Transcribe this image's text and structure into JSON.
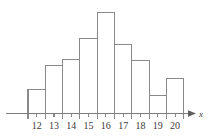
{
  "chart_data": {
    "type": "bar",
    "title": "",
    "subtitle": "",
    "xlabel": "x",
    "ylabel": "",
    "categories": [
      "12",
      "13",
      "14",
      "15",
      "16",
      "17",
      "18",
      "19",
      "20"
    ],
    "values": [
      24,
      48,
      54,
      75,
      101,
      69,
      53,
      18,
      35
    ],
    "tick_labels": [
      "12",
      "13",
      "14",
      "15",
      "16",
      "17",
      "18",
      "19",
      "20"
    ],
    "xlim": [
      11.5,
      20.5
    ],
    "ylim": [
      0,
      110
    ],
    "grid": false,
    "legend": null,
    "legend_position": "none",
    "annotations": [],
    "bar_fill_color": "#ffffff",
    "bar_stroke_color": "#8a8a8a",
    "axis_color": "#7d7d7d",
    "label_color": "#3a3a3a",
    "background_color": "#ffffff"
  },
  "axis": {
    "x_axis_name": "x",
    "arrow_direction": "right"
  }
}
